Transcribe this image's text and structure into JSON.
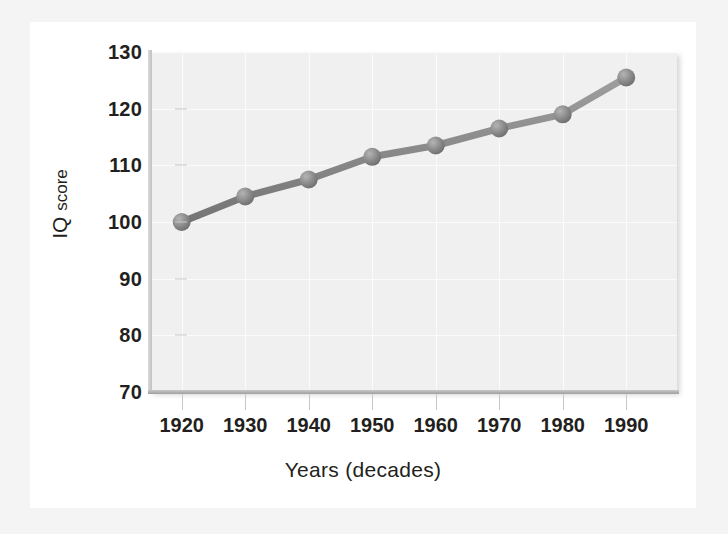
{
  "figure": {
    "background_color": "#f4f4f5",
    "card_color": "#ffffff",
    "plot_color": "#f0f0f0",
    "series_color": "#8a8a8a",
    "text_color": "#231f20"
  },
  "axis_titles": {
    "x": "Years (decades)",
    "y_main": "IQ",
    "y_sub": "score"
  },
  "chart_data": {
    "type": "line",
    "title": "",
    "xlabel": "Years (decades)",
    "ylabel": "IQ score",
    "x": [
      1920,
      1930,
      1940,
      1950,
      1960,
      1970,
      1980,
      1990
    ],
    "categories": [
      "1920",
      "1930",
      "1940",
      "1950",
      "1960",
      "1970",
      "1980",
      "1990"
    ],
    "series": [
      {
        "name": "IQ score",
        "values": [
          100.0,
          104.5,
          107.5,
          111.5,
          113.5,
          116.5,
          119.0,
          125.5
        ],
        "color": "#8a8a8a",
        "marker": "circle"
      }
    ],
    "xlim": [
      1915,
      1998
    ],
    "ylim": [
      70,
      130
    ],
    "xticks": [
      1920,
      1930,
      1940,
      1950,
      1960,
      1970,
      1980,
      1990
    ],
    "xtick_labels": [
      "1920",
      "1930",
      "1940",
      "1950",
      "1960",
      "1970",
      "1980",
      "1990"
    ],
    "yticks": [
      70,
      80,
      90,
      100,
      110,
      120,
      130
    ],
    "ytick_labels": [
      "70",
      "80",
      "90",
      "100",
      "110",
      "120",
      "130"
    ],
    "grid": true,
    "legend": false
  }
}
